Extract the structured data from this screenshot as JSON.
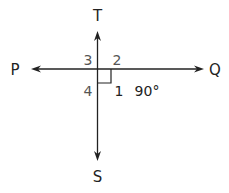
{
  "diagram": {
    "points": {
      "P": "P",
      "Q": "Q",
      "T": "T",
      "S": "S"
    },
    "angles": {
      "a1": "1",
      "a2": "2",
      "a3": "3",
      "a4": "4"
    },
    "angle_measure": "90°",
    "right_angle_marker": "angle-1",
    "colors": {
      "lines": "#222222",
      "angle_labels_muted": "#555555",
      "angle_labels_dark": "#222222"
    }
  }
}
